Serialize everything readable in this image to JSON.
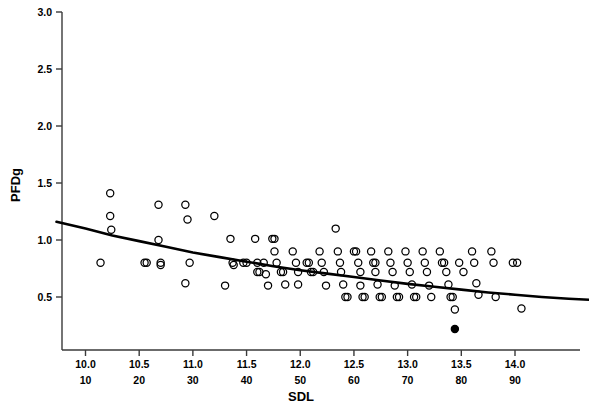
{
  "chart_data": {
    "type": "scatter",
    "title": "",
    "xlabel": "SDL",
    "ylabel": "PFDg",
    "xlim": [
      9.73,
      14.7
    ],
    "ylim": [
      0.13,
      3.0
    ],
    "grid": false,
    "legend": null,
    "axis": {
      "y_ticks": [
        0.5,
        1.0,
        1.5,
        2.0,
        2.5,
        3.0
      ],
      "y_tick_labels": [
        "0.5",
        "1.0",
        "1.5",
        "2.0",
        "2.5",
        "3.0"
      ],
      "x_ticks": [
        10.0,
        10.5,
        11.0,
        11.5,
        12.0,
        12.5,
        13.0,
        13.5,
        14.0
      ],
      "x_tick_labels_primary": [
        "10.0",
        "10.5",
        "11.0",
        "11.5",
        "12.0",
        "12.5",
        "13.0",
        "13.5",
        "14.0"
      ],
      "x_tick_labels_secondary": [
        "10",
        "20",
        "30",
        "40",
        "50",
        "60",
        "70",
        "80",
        "90"
      ]
    },
    "series": [
      {
        "name": "observations",
        "marker": "open-circle",
        "color": "#000000",
        "points": [
          [
            10.23,
            1.41
          ],
          [
            10.23,
            1.21
          ],
          [
            10.24,
            1.09
          ],
          [
            10.14,
            0.8
          ],
          [
            10.68,
            1.31
          ],
          [
            10.68,
            1.0
          ],
          [
            10.7,
            0.8
          ],
          [
            10.7,
            0.78
          ],
          [
            10.55,
            0.8
          ],
          [
            10.57,
            0.8
          ],
          [
            10.93,
            1.31
          ],
          [
            10.95,
            1.18
          ],
          [
            10.97,
            0.8
          ],
          [
            10.93,
            0.62
          ],
          [
            11.2,
            1.21
          ],
          [
            11.35,
            1.01
          ],
          [
            11.37,
            0.8
          ],
          [
            11.38,
            0.78
          ],
          [
            11.3,
            0.6
          ],
          [
            11.47,
            0.8
          ],
          [
            11.5,
            0.8
          ],
          [
            11.58,
            1.01
          ],
          [
            11.6,
            0.8
          ],
          [
            11.6,
            0.72
          ],
          [
            11.62,
            0.72
          ],
          [
            11.66,
            0.8
          ],
          [
            11.68,
            0.7
          ],
          [
            11.7,
            0.6
          ],
          [
            11.74,
            1.01
          ],
          [
            11.76,
            1.01
          ],
          [
            11.76,
            0.9
          ],
          [
            11.78,
            0.8
          ],
          [
            11.82,
            0.72
          ],
          [
            11.84,
            0.72
          ],
          [
            11.86,
            0.61
          ],
          [
            11.93,
            0.9
          ],
          [
            11.96,
            0.8
          ],
          [
            11.98,
            0.72
          ],
          [
            11.98,
            0.61
          ],
          [
            12.06,
            0.8
          ],
          [
            12.08,
            0.8
          ],
          [
            12.1,
            0.72
          ],
          [
            12.12,
            0.72
          ],
          [
            12.18,
            0.9
          ],
          [
            12.2,
            0.8
          ],
          [
            12.22,
            0.72
          ],
          [
            12.24,
            0.6
          ],
          [
            12.33,
            1.1
          ],
          [
            12.35,
            0.9
          ],
          [
            12.37,
            0.8
          ],
          [
            12.38,
            0.72
          ],
          [
            12.4,
            0.61
          ],
          [
            12.42,
            0.5
          ],
          [
            12.44,
            0.5
          ],
          [
            12.5,
            0.9
          ],
          [
            12.52,
            0.9
          ],
          [
            12.54,
            0.8
          ],
          [
            12.56,
            0.72
          ],
          [
            12.56,
            0.6
          ],
          [
            12.58,
            0.5
          ],
          [
            12.6,
            0.5
          ],
          [
            12.66,
            0.9
          ],
          [
            12.68,
            0.8
          ],
          [
            12.7,
            0.8
          ],
          [
            12.7,
            0.72
          ],
          [
            12.72,
            0.61
          ],
          [
            12.74,
            0.5
          ],
          [
            12.76,
            0.5
          ],
          [
            12.82,
            0.9
          ],
          [
            12.84,
            0.8
          ],
          [
            12.86,
            0.72
          ],
          [
            12.88,
            0.6
          ],
          [
            12.9,
            0.5
          ],
          [
            12.92,
            0.5
          ],
          [
            12.98,
            0.9
          ],
          [
            13.0,
            0.8
          ],
          [
            13.02,
            0.72
          ],
          [
            13.04,
            0.61
          ],
          [
            13.06,
            0.5
          ],
          [
            13.08,
            0.5
          ],
          [
            13.14,
            0.9
          ],
          [
            13.16,
            0.8
          ],
          [
            13.18,
            0.72
          ],
          [
            13.2,
            0.6
          ],
          [
            13.22,
            0.5
          ],
          [
            13.3,
            0.9
          ],
          [
            13.32,
            0.8
          ],
          [
            13.34,
            0.8
          ],
          [
            13.36,
            0.72
          ],
          [
            13.38,
            0.61
          ],
          [
            13.4,
            0.5
          ],
          [
            13.42,
            0.5
          ],
          [
            13.44,
            0.39
          ],
          [
            13.48,
            0.8
          ],
          [
            13.52,
            0.72
          ],
          [
            13.6,
            0.9
          ],
          [
            13.62,
            0.8
          ],
          [
            13.64,
            0.62
          ],
          [
            13.66,
            0.52
          ],
          [
            13.78,
            0.9
          ],
          [
            13.8,
            0.8
          ],
          [
            13.82,
            0.5
          ],
          [
            13.98,
            0.8
          ],
          [
            14.02,
            0.8
          ],
          [
            14.06,
            0.4
          ]
        ]
      },
      {
        "name": "highlighted-observation",
        "marker": "filled-circle",
        "color": "#000000",
        "points": [
          [
            13.44,
            0.22
          ]
        ]
      }
    ],
    "fit_line": {
      "name": "fitted-curve",
      "color": "#000000",
      "points": [
        [
          9.73,
          1.16
        ],
        [
          10.0,
          1.1
        ],
        [
          10.25,
          1.04
        ],
        [
          10.5,
          0.99
        ],
        [
          10.75,
          0.94
        ],
        [
          11.0,
          0.89
        ],
        [
          11.25,
          0.85
        ],
        [
          11.5,
          0.81
        ],
        [
          11.75,
          0.77
        ],
        [
          12.0,
          0.735
        ],
        [
          12.25,
          0.705
        ],
        [
          12.5,
          0.675
        ],
        [
          12.75,
          0.645
        ],
        [
          13.0,
          0.615
        ],
        [
          13.25,
          0.59
        ],
        [
          13.5,
          0.565
        ],
        [
          13.75,
          0.54
        ],
        [
          14.0,
          0.52
        ],
        [
          14.25,
          0.5
        ],
        [
          14.5,
          0.485
        ],
        [
          14.7,
          0.475
        ]
      ]
    }
  }
}
